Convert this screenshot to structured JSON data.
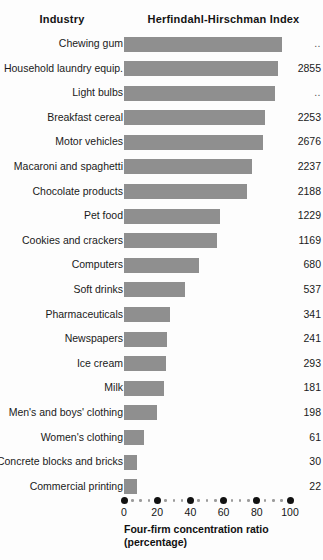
{
  "headers": {
    "industry": "Industry",
    "hhi": "Herfindahl-Hirschman Index"
  },
  "axis": {
    "title_line1": "Four-firm concentration ratio",
    "title_line2": "(percentage)",
    "ticks": [
      "0",
      "20",
      "40",
      "60",
      "80",
      "100"
    ],
    "min": 0,
    "max": 100
  },
  "colors": {
    "bar": "#8f8f8f",
    "text": "#1a1a1a",
    "background": "#fdfdfd",
    "tick_dot": "#111111",
    "minor_dot": "#9b9b9b"
  },
  "chart_data": {
    "type": "bar",
    "orientation": "horizontal",
    "title": "",
    "xlabel": "Four-firm concentration ratio (percentage)",
    "ylabel": "Industry",
    "xlim": [
      0,
      100
    ],
    "grid": false,
    "legend": null,
    "categories": [
      "Chewing gum",
      "Household laundry equip.",
      "Light bulbs",
      "Breakfast cereal",
      "Motor vehicles",
      "Macaroni and spaghetti",
      "Chocolate products",
      "Pet food",
      "Cookies and crackers",
      "Computers",
      "Soft drinks",
      "Pharmaceuticals",
      "Newspapers",
      "Ice cream",
      "Milk",
      "Men's and boys' clothing",
      "Women's clothing",
      "Concrete blocks and bricks",
      "Commercial printing"
    ],
    "series": [
      {
        "name": "Four-firm concentration ratio",
        "values": [
          95,
          93,
          91,
          85,
          84,
          77,
          74,
          58,
          56,
          45,
          37,
          28,
          26,
          25,
          24,
          20,
          12,
          8,
          8
        ]
      }
    ],
    "value_labels": {
      "name": "Herfindahl-Hirschman Index",
      "values": [
        "..",
        "2855",
        "..",
        "2253",
        "2676",
        "2237",
        "2188",
        "1229",
        "1169",
        "680",
        "537",
        "341",
        "241",
        "293",
        "181",
        "198",
        "61",
        "30",
        "22"
      ]
    },
    "rows": [
      {
        "industry": "Chewing gum",
        "ratio": 95,
        "hhi": ".."
      },
      {
        "industry": "Household laundry equip.",
        "ratio": 93,
        "hhi": "2855"
      },
      {
        "industry": "Light bulbs",
        "ratio": 91,
        "hhi": ".."
      },
      {
        "industry": "Breakfast cereal",
        "ratio": 85,
        "hhi": "2253"
      },
      {
        "industry": "Motor vehicles",
        "ratio": 84,
        "hhi": "2676"
      },
      {
        "industry": "Macaroni and spaghetti",
        "ratio": 77,
        "hhi": "2237"
      },
      {
        "industry": "Chocolate products",
        "ratio": 74,
        "hhi": "2188"
      },
      {
        "industry": "Pet food",
        "ratio": 58,
        "hhi": "1229"
      },
      {
        "industry": "Cookies and crackers",
        "ratio": 56,
        "hhi": "1169"
      },
      {
        "industry": "Computers",
        "ratio": 45,
        "hhi": "680"
      },
      {
        "industry": "Soft drinks",
        "ratio": 37,
        "hhi": "537"
      },
      {
        "industry": "Pharmaceuticals",
        "ratio": 28,
        "hhi": "341"
      },
      {
        "industry": "Newspapers",
        "ratio": 26,
        "hhi": "241"
      },
      {
        "industry": "Ice cream",
        "ratio": 25,
        "hhi": "293"
      },
      {
        "industry": "Milk",
        "ratio": 24,
        "hhi": "181"
      },
      {
        "industry": "Men's and boys' clothing",
        "ratio": 20,
        "hhi": "198"
      },
      {
        "industry": "Women's clothing",
        "ratio": 12,
        "hhi": "61"
      },
      {
        "industry": "Concrete blocks and bricks",
        "ratio": 8,
        "hhi": "30"
      },
      {
        "industry": "Commercial printing",
        "ratio": 8,
        "hhi": "22"
      }
    ]
  }
}
